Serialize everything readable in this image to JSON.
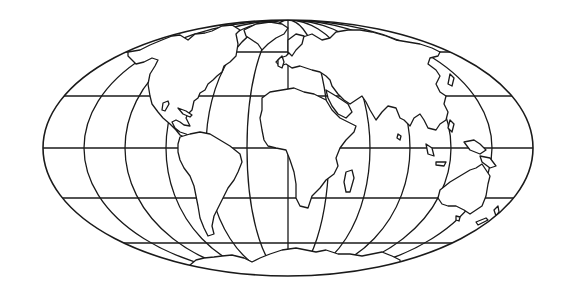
{
  "map": {
    "title": "World map outline",
    "projection": "Mollweide (equal-area, elliptical)",
    "style": "black outline on white, no labels",
    "colors": {
      "background": "#ffffff",
      "line": "#1a1a1a",
      "land_fill": "#ffffff"
    },
    "graticule": {
      "meridian_spacing_deg": 30,
      "parallel_spacing_deg": 30,
      "parallels": [
        "60N",
        "30N",
        "Equator",
        "30S",
        "60S"
      ]
    },
    "continents": [
      "North America",
      "South America",
      "Europe",
      "Africa",
      "Asia",
      "Australia",
      "Antarctica"
    ],
    "labels_visible": false
  }
}
